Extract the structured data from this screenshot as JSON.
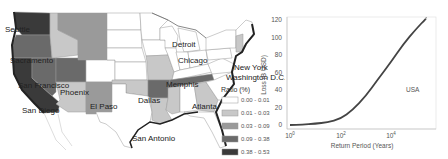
{
  "map": {
    "legend_title": "Ratio (%)",
    "legend": [
      {
        "label": "0.00 - 0.01",
        "color": "#ffffff"
      },
      {
        "label": "0.01 - 0.03",
        "color": "#c8c8c8"
      },
      {
        "label": "0.03 - 0.09",
        "color": "#9a9a9a"
      },
      {
        "label": "0.09 - 0.38",
        "color": "#6a6a6a"
      },
      {
        "label": "0.38 - 0.53",
        "color": "#3a3a3a"
      }
    ],
    "cities": [
      "Seattle",
      "Sacramento",
      "San Francisco",
      "San Diego",
      "Phoenix",
      "El Paso",
      "Dallas",
      "San Antonio",
      "Memphis",
      "Atlanta",
      "Chicago",
      "Detroit",
      "New York",
      "Washington D.C."
    ]
  },
  "chart_data": {
    "type": "line",
    "title": "",
    "xlabel": "Return Period (Years)",
    "ylabel": "Loss (B USD)",
    "xscale": "log",
    "x_ticks": [
      "10^0",
      "10^2",
      "10^4"
    ],
    "y_ticks": [
      0,
      20,
      40,
      60,
      80,
      100,
      120
    ],
    "ylim": [
      0,
      125
    ],
    "annotation": "USA",
    "grid": false,
    "series": [
      {
        "name": "USA",
        "x": [
          1,
          3,
          10,
          30,
          100,
          300,
          1000,
          3000,
          10000,
          30000,
          100000,
          250000
        ],
        "y": [
          0,
          0.5,
          1.5,
          3,
          7,
          17,
          33,
          52,
          72,
          92,
          110,
          122
        ]
      }
    ]
  },
  "plot_labels": {
    "xlabel": "Return Period (Years)",
    "ylabel": "Loss (B USD)",
    "annotation": "USA",
    "y0": "0",
    "y20": "20",
    "y40": "40",
    "y60": "60",
    "y80": "80",
    "y100": "100",
    "y120": "120",
    "x0_base": "10",
    "x0_exp": "0",
    "x2_base": "10",
    "x2_exp": "2",
    "x4_base": "10",
    "x4_exp": "4"
  }
}
